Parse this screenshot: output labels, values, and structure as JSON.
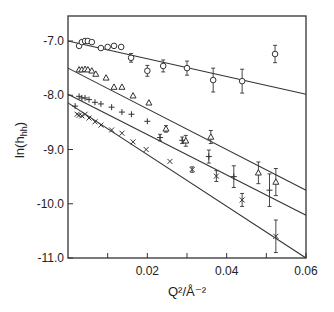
{
  "chart_data": {
    "type": "scatter",
    "title": "",
    "xlabel": "Q²/Å⁻²",
    "ylabel": "ln(h_hh)",
    "xlim": [
      0,
      0.06
    ],
    "ylim": [
      -11.0,
      -6.54
    ],
    "grid": false,
    "legend": "none",
    "x_ticks": [
      0.01,
      0.02,
      0.03,
      0.04,
      0.05,
      0.06
    ],
    "x_tick_labels": [
      {
        "value": 0.02,
        "label": "0.02"
      },
      {
        "value": 0.04,
        "label": "0.04"
      },
      {
        "value": 0.06,
        "label": "0.06"
      }
    ],
    "y_tick_labels": [
      {
        "value": -7.0,
        "label": "-7.0"
      },
      {
        "value": -8.0,
        "label": "-8.0"
      },
      {
        "value": -9.0,
        "label": "-9.0"
      },
      {
        "value": -10.0,
        "label": "-10.0"
      },
      {
        "value": -11.0,
        "label": "-11.0"
      }
    ],
    "series": [
      {
        "name": "circles",
        "marker": "circle",
        "fit_line": {
          "x": [
            0,
            0.06
          ],
          "y": [
            -7.0,
            -7.98
          ]
        },
        "points": [
          {
            "x": 0.0028,
            "y": -7.09
          },
          {
            "x": 0.0035,
            "y": -7.02
          },
          {
            "x": 0.0043,
            "y": -7.0
          },
          {
            "x": 0.005,
            "y": -7.0
          },
          {
            "x": 0.006,
            "y": -7.02
          },
          {
            "x": 0.0083,
            "y": -7.13
          },
          {
            "x": 0.01,
            "y": -7.11
          },
          {
            "x": 0.0116,
            "y": -7.09
          },
          {
            "x": 0.0134,
            "y": -7.11
          },
          {
            "x": 0.0159,
            "y": -7.31,
            "err": 0.08
          },
          {
            "x": 0.02,
            "y": -7.55,
            "err": 0.1
          },
          {
            "x": 0.024,
            "y": -7.46,
            "err": 0.11
          },
          {
            "x": 0.03,
            "y": -7.5,
            "err": 0.13
          },
          {
            "x": 0.0366,
            "y": -7.72,
            "err": 0.22
          },
          {
            "x": 0.0439,
            "y": -7.74,
            "err": 0.22
          },
          {
            "x": 0.0522,
            "y": -7.24,
            "err": 0.16
          }
        ]
      },
      {
        "name": "triangles",
        "marker": "triangle",
        "fit_line": {
          "x": [
            0,
            0.06
          ],
          "y": [
            -7.5,
            -9.75
          ]
        },
        "points": [
          {
            "x": 0.0028,
            "y": -7.53
          },
          {
            "x": 0.0035,
            "y": -7.53
          },
          {
            "x": 0.0043,
            "y": -7.52
          },
          {
            "x": 0.005,
            "y": -7.53
          },
          {
            "x": 0.006,
            "y": -7.55
          },
          {
            "x": 0.007,
            "y": -7.61
          },
          {
            "x": 0.0096,
            "y": -7.68
          },
          {
            "x": 0.0116,
            "y": -7.85
          },
          {
            "x": 0.0136,
            "y": -7.85
          },
          {
            "x": 0.0164,
            "y": -8.01
          },
          {
            "x": 0.0204,
            "y": -8.14
          },
          {
            "x": 0.0247,
            "y": -8.62,
            "err": 0.06
          },
          {
            "x": 0.0297,
            "y": -8.84,
            "err": 0.1
          },
          {
            "x": 0.036,
            "y": -8.77,
            "err": 0.12
          },
          {
            "x": 0.048,
            "y": -9.43,
            "err": 0.2
          },
          {
            "x": 0.0524,
            "y": -9.6,
            "err": 0.25
          }
        ]
      },
      {
        "name": "plus",
        "marker": "plus",
        "fit_line": {
          "x": [
            0,
            0.06
          ],
          "y": [
            -7.98,
            -10.21
          ]
        },
        "points": [
          {
            "x": 0.0018,
            "y": -8.2
          },
          {
            "x": 0.0028,
            "y": -8.02
          },
          {
            "x": 0.0035,
            "y": -8.05
          },
          {
            "x": 0.0043,
            "y": -8.05
          },
          {
            "x": 0.0053,
            "y": -8.08
          },
          {
            "x": 0.0068,
            "y": -8.13
          },
          {
            "x": 0.0083,
            "y": -8.16
          },
          {
            "x": 0.011,
            "y": -8.22
          },
          {
            "x": 0.0136,
            "y": -8.31
          },
          {
            "x": 0.016,
            "y": -8.35
          },
          {
            "x": 0.02,
            "y": -8.48
          },
          {
            "x": 0.0232,
            "y": -8.78,
            "err": 0.06
          },
          {
            "x": 0.0288,
            "y": -8.83,
            "err": 0.06
          },
          {
            "x": 0.0355,
            "y": -9.13,
            "err": 0.12
          },
          {
            "x": 0.0418,
            "y": -9.5,
            "err": 0.2
          },
          {
            "x": 0.0508,
            "y": -9.75,
            "err": 0.3
          }
        ]
      },
      {
        "name": "crosses",
        "marker": "cross",
        "fit_line": {
          "x": [
            0,
            0.06
          ],
          "y": [
            -8.14,
            -11.0
          ]
        },
        "points": [
          {
            "x": 0.0023,
            "y": -8.35
          },
          {
            "x": 0.0028,
            "y": -8.37
          },
          {
            "x": 0.0035,
            "y": -8.38
          },
          {
            "x": 0.0043,
            "y": -8.35
          },
          {
            "x": 0.0053,
            "y": -8.42
          },
          {
            "x": 0.0068,
            "y": -8.49
          },
          {
            "x": 0.0083,
            "y": -8.55
          },
          {
            "x": 0.011,
            "y": -8.64
          },
          {
            "x": 0.0136,
            "y": -8.7
          },
          {
            "x": 0.0164,
            "y": -8.86
          },
          {
            "x": 0.0197,
            "y": -9.0
          },
          {
            "x": 0.0257,
            "y": -9.22
          },
          {
            "x": 0.0313,
            "y": -9.37,
            "err": 0.05
          },
          {
            "x": 0.0374,
            "y": -9.49,
            "err": 0.1
          },
          {
            "x": 0.0439,
            "y": -9.93,
            "err": 0.12
          },
          {
            "x": 0.0524,
            "y": -10.6,
            "err": 0.3
          }
        ]
      }
    ]
  }
}
